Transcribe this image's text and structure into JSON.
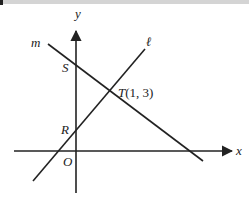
{
  "figure": {
    "axes": {
      "x_label": "x",
      "y_label": "y",
      "origin_label": "O"
    },
    "lines": [
      {
        "name": "m",
        "label": "m",
        "passes_through": [
          "S",
          "T"
        ],
        "slope_sign": "negative"
      },
      {
        "name": "l",
        "label": "ℓ",
        "passes_through": [
          "R",
          "T"
        ],
        "slope_sign": "positive"
      }
    ],
    "points": {
      "S": {
        "label": "S",
        "description": "y-intercept of line m"
      },
      "R": {
        "label": "R",
        "description": "y-intercept of line ℓ"
      },
      "T": {
        "label": "T",
        "coords_text": "(1, 3)",
        "description": "intersection of lines m and ℓ"
      }
    }
  },
  "colors": {
    "ink": "#222222",
    "top_bar": "#d4d4d4",
    "background": "#ffffff"
  }
}
